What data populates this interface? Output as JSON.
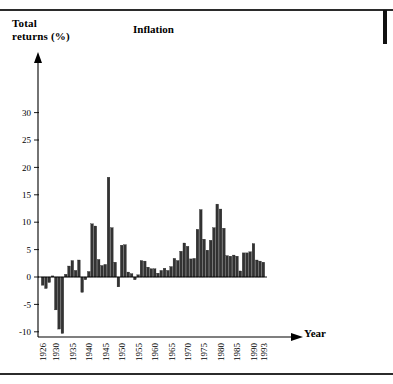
{
  "figure": {
    "title": "Inflation",
    "y_axis_title_line1": "Total",
    "y_axis_title_line2": "returns (%)",
    "x_axis_title": "Year"
  },
  "chart_data": {
    "type": "bar",
    "title": "Inflation",
    "xlabel": "Year",
    "ylabel": "Total returns (%)",
    "ylim": [
      -10,
      32
    ],
    "xlim": [
      1926,
      1993
    ],
    "grid": false,
    "legend": null,
    "bar_color": "#333333",
    "y_ticks": [
      -10,
      -5,
      0,
      5,
      10,
      15,
      20,
      25,
      30
    ],
    "y_tick_labels": [
      "-10",
      "-5",
      "0",
      "5",
      "10",
      "15",
      "20",
      "25",
      "30"
    ],
    "x_ticks": [
      1926,
      1930,
      1935,
      1940,
      1945,
      1950,
      1955,
      1960,
      1965,
      1970,
      1975,
      1980,
      1985,
      1990,
      1993
    ],
    "x_tick_labels": [
      "1926",
      "1930",
      "1935",
      "1940",
      "1945",
      "1950",
      "1955",
      "1960",
      "1965",
      "1970",
      "1975",
      "1980",
      "1985",
      "1990",
      "1993"
    ],
    "categories": [
      1926,
      1927,
      1928,
      1929,
      1930,
      1931,
      1932,
      1933,
      1934,
      1935,
      1936,
      1937,
      1938,
      1939,
      1940,
      1941,
      1942,
      1943,
      1944,
      1945,
      1946,
      1947,
      1948,
      1949,
      1950,
      1951,
      1952,
      1953,
      1954,
      1955,
      1956,
      1957,
      1958,
      1959,
      1960,
      1961,
      1962,
      1963,
      1964,
      1965,
      1966,
      1967,
      1968,
      1969,
      1970,
      1971,
      1972,
      1973,
      1974,
      1975,
      1976,
      1977,
      1978,
      1979,
      1980,
      1981,
      1982,
      1983,
      1984,
      1985,
      1986,
      1987,
      1988,
      1989,
      1990,
      1991,
      1992,
      1993
    ],
    "values": [
      -1.5,
      -2.1,
      -1.0,
      0.2,
      -6.0,
      -9.5,
      -10.3,
      0.5,
      2.0,
      3.0,
      1.2,
      3.1,
      -2.8,
      -0.5,
      1.0,
      9.7,
      9.3,
      3.2,
      2.1,
      2.3,
      18.2,
      9.0,
      2.7,
      -1.8,
      5.8,
      5.9,
      0.9,
      0.6,
      -0.5,
      0.4,
      3.0,
      2.9,
      1.8,
      1.5,
      1.5,
      0.7,
      1.2,
      1.6,
      1.2,
      1.9,
      3.4,
      3.0,
      4.7,
      6.2,
      5.6,
      3.3,
      3.4,
      8.7,
      12.3,
      6.9,
      4.9,
      6.7,
      9.0,
      13.3,
      12.4,
      8.9,
      3.9,
      3.8,
      4.0,
      3.8,
      1.1,
      4.4,
      4.4,
      4.6,
      6.1,
      3.1,
      2.9,
      2.7
    ]
  }
}
